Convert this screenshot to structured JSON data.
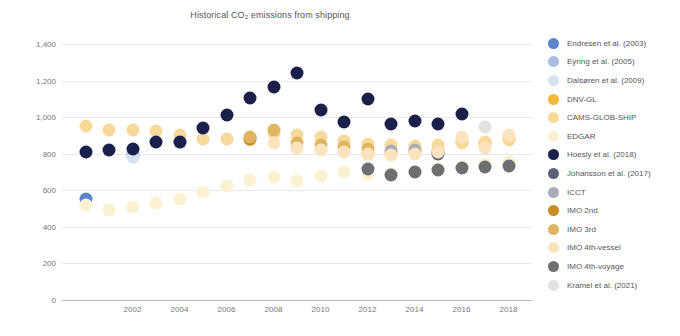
{
  "chart_data": {
    "type": "scatter",
    "title": "Historical CO₂ emissions from shipping",
    "xlabel": "",
    "ylabel": "CO₂ emissions [Mt yr⁻¹]",
    "xlim": [
      1999,
      2019
    ],
    "ylim": [
      0,
      1400
    ],
    "grid": true,
    "legend_position": "right",
    "x_ticks": [
      "2002",
      "2004",
      "2006",
      "2008",
      "2010",
      "2012",
      "2014",
      "2016",
      "2018"
    ],
    "x_tick_values": [
      2002,
      2004,
      2006,
      2008,
      2010,
      2012,
      2014,
      2016,
      2018
    ],
    "y_ticks": [
      "0",
      "200",
      "400",
      "600",
      "800",
      "1,000",
      "1,200",
      "1,400"
    ],
    "y_tick_values": [
      0,
      200,
      400,
      600,
      800,
      1000,
      1200,
      1400
    ],
    "series": [
      {
        "name": "Endresen et al. (2003)",
        "color": "#5B85CF",
        "points": [
          [
            2000,
            555
          ],
          [
            2002,
            795
          ]
        ]
      },
      {
        "name": "Eyring et al. (2005)",
        "color": "#A8BDE2",
        "points": [
          [
            2002,
            800
          ]
        ]
      },
      {
        "name": "Dalsøren et al. (2009)",
        "color": "#D6E2F3",
        "points": [
          [
            2002,
            780
          ],
          [
            2004,
            860
          ]
        ]
      },
      {
        "name": "DNV-GL",
        "color": "#F5B63C",
        "points": [
          [
            2012,
            800
          ],
          [
            2013,
            800
          ],
          [
            2014,
            810
          ],
          [
            2015,
            815
          ],
          [
            2016,
            865
          ],
          [
            2017,
            860
          ],
          [
            2018,
            880
          ]
        ]
      },
      {
        "name": "CAMS-GLOB-SHIP",
        "color": "#F7D99A",
        "points": [
          [
            2000,
            950
          ],
          [
            2001,
            930
          ],
          [
            2002,
            930
          ],
          [
            2003,
            925
          ],
          [
            2004,
            905
          ],
          [
            2005,
            880
          ],
          [
            2006,
            880
          ],
          [
            2007,
            875
          ],
          [
            2008,
            915
          ],
          [
            2009,
            900
          ],
          [
            2010,
            890
          ],
          [
            2011,
            870
          ],
          [
            2012,
            855
          ],
          [
            2013,
            850
          ],
          [
            2014,
            840
          ],
          [
            2015,
            845
          ],
          [
            2016,
            860
          ],
          [
            2017,
            865
          ],
          [
            2018,
            875
          ]
        ]
      },
      {
        "name": "EDGAR",
        "color": "#FBF0CF",
        "points": [
          [
            2000,
            520
          ],
          [
            2001,
            490
          ],
          [
            2002,
            510
          ],
          [
            2003,
            530
          ],
          [
            2004,
            555
          ],
          [
            2005,
            590
          ],
          [
            2006,
            625
          ],
          [
            2007,
            655
          ],
          [
            2008,
            670
          ],
          [
            2009,
            650
          ],
          [
            2010,
            680
          ],
          [
            2011,
            700
          ],
          [
            2012,
            690
          ],
          [
            2013,
            690
          ],
          [
            2014,
            700
          ],
          [
            2015,
            715
          ],
          [
            2016,
            730
          ],
          [
            2017,
            745
          ],
          [
            2018,
            755
          ]
        ]
      },
      {
        "name": "Hoesly et al. (2018)",
        "color": "#1B1F4B",
        "points": [
          [
            2000,
            810
          ],
          [
            2001,
            820
          ],
          [
            2002,
            825
          ],
          [
            2003,
            865
          ],
          [
            2004,
            865
          ],
          [
            2005,
            940
          ],
          [
            2006,
            1010
          ],
          [
            2007,
            1105
          ],
          [
            2008,
            1165
          ],
          [
            2009,
            1240
          ],
          [
            2010,
            1040
          ],
          [
            2011,
            975
          ],
          [
            2012,
            1100
          ],
          [
            2013,
            965
          ],
          [
            2014,
            980
          ],
          [
            2015,
            965
          ],
          [
            2016,
            1015
          ]
        ]
      },
      {
        "name": "Johansson et al. (2017)",
        "color": "#5B6178",
        "points": [
          [
            2015,
            800
          ]
        ]
      },
      {
        "name": "ICCT",
        "color": "#A7ACB8",
        "points": [
          [
            2013,
            815
          ],
          [
            2014,
            820
          ],
          [
            2015,
            810
          ]
        ]
      },
      {
        "name": "IMO 2nd",
        "color": "#C98A28",
        "points": [
          [
            2007,
            880
          ]
        ]
      },
      {
        "name": "IMO 3rd",
        "color": "#E0B461",
        "points": [
          [
            2007,
            890
          ],
          [
            2008,
            930
          ],
          [
            2009,
            860
          ],
          [
            2010,
            850
          ],
          [
            2011,
            835
          ],
          [
            2012,
            825
          ]
        ]
      },
      {
        "name": "IMO 4th-vessel",
        "color": "#FAE3BE",
        "points": [
          [
            2008,
            860
          ],
          [
            2009,
            830
          ],
          [
            2010,
            820
          ],
          [
            2011,
            810
          ],
          [
            2012,
            800
          ],
          [
            2013,
            795
          ],
          [
            2014,
            800
          ],
          [
            2015,
            810
          ],
          [
            2016,
            890
          ],
          [
            2017,
            830
          ],
          [
            2018,
            900
          ]
        ]
      },
      {
        "name": "IMO 4th-voyage",
        "color": "#6D6F73",
        "points": [
          [
            2012,
            715
          ],
          [
            2013,
            685
          ],
          [
            2014,
            700
          ],
          [
            2015,
            710
          ],
          [
            2016,
            720
          ],
          [
            2017,
            730
          ],
          [
            2018,
            735
          ]
        ]
      },
      {
        "name": "Kramel et al. (2021)",
        "color": "#E2E2E2",
        "points": [
          [
            2017,
            945
          ]
        ]
      }
    ]
  },
  "legend": {
    "items": [
      {
        "label": "Endresen et al. (2003)",
        "color": "#5B85CF"
      },
      {
        "label": "Eyring et al. (2005)",
        "color": "#A8BDE2"
      },
      {
        "label": "Dalsøren et al. (2009)",
        "color": "#D6E2F3"
      },
      {
        "label": "DNV-GL",
        "color": "#F5B63C"
      },
      {
        "label": "CAMS-GLOB-SHIP",
        "color": "#F7D99A"
      },
      {
        "label": "EDGAR",
        "color": "#FBF0CF"
      },
      {
        "label": "Hoesly et al. (2018)",
        "color": "#1B1F4B"
      },
      {
        "label": "Johansson et al. (2017)",
        "color": "#5B6178"
      },
      {
        "label": "ICCT",
        "color": "#A7ACB8"
      },
      {
        "label": "IMO 2nd",
        "color": "#C98A28"
      },
      {
        "label": "IMO 3rd",
        "color": "#E0B461"
      },
      {
        "label": "IMO 4th-vessel",
        "color": "#FAE3BE"
      },
      {
        "label": "IMO 4th-voyage",
        "color": "#6D6F73"
      },
      {
        "label": "Kramel et al. (2021)",
        "color": "#E2E2E2"
      }
    ]
  }
}
